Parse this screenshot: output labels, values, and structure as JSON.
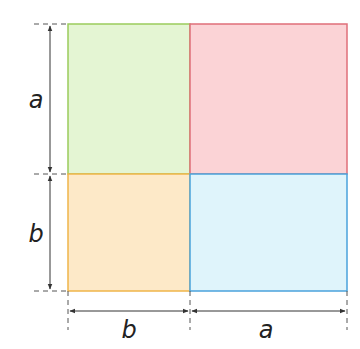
{
  "diagram": {
    "type": "square-decomposition",
    "labels": {
      "left_top": "a",
      "left_bottom": "b",
      "bottom_left": "b",
      "bottom_right": "a"
    },
    "regions": [
      {
        "id": "top-left",
        "size": "b × a",
        "fill": "#e4f5d3",
        "stroke": "#9bcc5c"
      },
      {
        "id": "top-right",
        "size": "a × a",
        "fill": "#fbd3d6",
        "stroke": "#df6f7a"
      },
      {
        "id": "bottom-left",
        "size": "b × b",
        "fill": "#fde9c8",
        "stroke": "#efb54a"
      },
      {
        "id": "bottom-right",
        "size": "a × b",
        "fill": "#dff4fb",
        "stroke": "#4aa2dc"
      }
    ],
    "colors": {
      "dimension_line": "#333333",
      "dash_line": "#555555"
    }
  }
}
